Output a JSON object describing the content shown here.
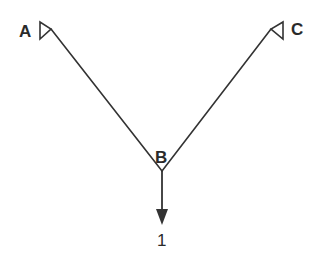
{
  "diagram": {
    "type": "two-bar truss",
    "nodes": [
      {
        "id": "A",
        "label": "A",
        "x": 51,
        "y": 29,
        "support": "pin"
      },
      {
        "id": "B",
        "label": "B",
        "x": 162,
        "y": 171,
        "support": "none"
      },
      {
        "id": "C",
        "label": "C",
        "x": 271,
        "y": 29,
        "support": "pin"
      }
    ],
    "members": [
      {
        "from": "A",
        "to": "B"
      },
      {
        "from": "C",
        "to": "B"
      }
    ],
    "loads": [
      {
        "at": "B",
        "direction": "down",
        "label": "1"
      }
    ],
    "colors": {
      "line": "#333333",
      "text": "#2a2a2a",
      "background": "#ffffff"
    }
  }
}
